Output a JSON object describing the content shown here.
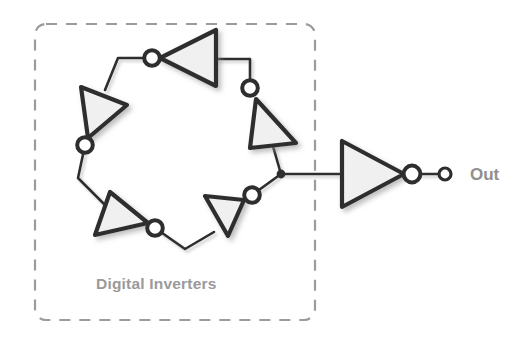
{
  "figure": {
    "type": "ring-oscillator-schematic",
    "background_color": "#ffffff",
    "wire_color": "#2e2e2e",
    "gate_fill_color": "#f0f0f0",
    "dashed_box_color": "#9b9b9b",
    "label_color": "#9a9a9a"
  },
  "group_box": {
    "label": "Digital Inverters",
    "style": "dashed-rounded-rectangle",
    "x": 35,
    "y": 24,
    "width": 280,
    "height": 296
  },
  "output": {
    "label": "Out",
    "terminal_name": "output-terminal",
    "x": 470,
    "y": 180
  },
  "ring": {
    "stage_count": 5,
    "description": "Five inverters connected head-to-tail in a closed loop",
    "inverters": [
      {
        "name": "inverter-1",
        "position": "top",
        "rotation_deg": 180,
        "bubble": "left"
      },
      {
        "name": "inverter-2",
        "position": "upper-right",
        "rotation_deg": 108,
        "bubble": "top"
      },
      {
        "name": "inverter-3",
        "position": "lower-right",
        "rotation_deg": 36,
        "bubble": "upper-right"
      },
      {
        "name": "inverter-4",
        "position": "lower-left",
        "rotation_deg": 324,
        "bubble": "lower-right"
      },
      {
        "name": "inverter-5",
        "position": "upper-left",
        "rotation_deg": 252,
        "bubble": "bottom"
      }
    ],
    "tap_junction": {
      "name": "output-tap-junction",
      "x": 281,
      "y": 174
    }
  },
  "buffer": {
    "name": "output-inverter",
    "orientation": "points-right",
    "bubble": "right"
  }
}
